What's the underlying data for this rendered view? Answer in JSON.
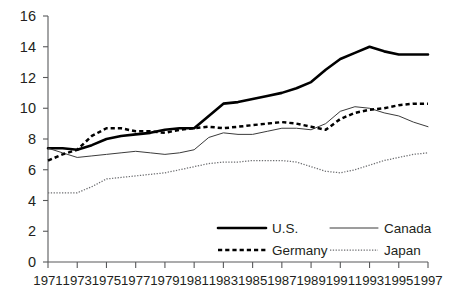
{
  "chart_data": {
    "type": "line",
    "title": "",
    "xlabel": "",
    "ylabel": "",
    "ylim": [
      0,
      16
    ],
    "xlim": [
      1971,
      1997
    ],
    "grid": false,
    "legend_position": "inside-bottom-center",
    "y_ticks": [
      "0",
      "2",
      "4",
      "6",
      "8",
      "10",
      "12",
      "14",
      "16"
    ],
    "x_ticks": [
      "1971",
      "1973",
      "1975",
      "1977",
      "1979",
      "1981",
      "1983",
      "1985",
      "1987",
      "1989",
      "1991",
      "1993",
      "1995",
      "1997"
    ],
    "x": [
      1971,
      1972,
      1973,
      1974,
      1975,
      1976,
      1977,
      1978,
      1979,
      1980,
      1981,
      1982,
      1983,
      1984,
      1985,
      1986,
      1987,
      1988,
      1989,
      1990,
      1991,
      1992,
      1993,
      1994,
      1995,
      1996,
      1997
    ],
    "series": [
      {
        "name": "U.S.",
        "style": "thick-solid",
        "values": [
          7.4,
          7.4,
          7.3,
          7.6,
          8.0,
          8.2,
          8.3,
          8.4,
          8.6,
          8.7,
          8.7,
          9.5,
          10.3,
          10.4,
          10.6,
          10.8,
          11.0,
          11.3,
          11.7,
          12.5,
          13.2,
          13.6,
          14.0,
          13.7,
          13.5,
          13.5,
          13.5
        ]
      },
      {
        "name": "Canada",
        "style": "thin-solid",
        "values": [
          7.4,
          7.1,
          6.8,
          6.9,
          7.0,
          7.1,
          7.2,
          7.1,
          7.0,
          7.1,
          7.3,
          8.1,
          8.4,
          8.3,
          8.3,
          8.5,
          8.7,
          8.7,
          8.6,
          9.0,
          9.8,
          10.1,
          10.0,
          9.7,
          9.5,
          9.1,
          8.8
        ]
      },
      {
        "name": "Germany",
        "style": "dashed",
        "values": [
          6.6,
          7.0,
          7.3,
          8.2,
          8.7,
          8.7,
          8.5,
          8.5,
          8.4,
          8.6,
          8.7,
          8.8,
          8.7,
          8.8,
          8.9,
          9.0,
          9.1,
          9.0,
          8.8,
          8.6,
          9.3,
          9.7,
          9.9,
          10.0,
          10.2,
          10.3,
          10.3
        ]
      },
      {
        "name": "Japan",
        "style": "dotted",
        "values": [
          4.5,
          4.5,
          4.5,
          4.9,
          5.4,
          5.5,
          5.6,
          5.7,
          5.8,
          6.0,
          6.2,
          6.4,
          6.5,
          6.5,
          6.6,
          6.6,
          6.6,
          6.5,
          6.2,
          5.9,
          5.8,
          6.0,
          6.3,
          6.6,
          6.8,
          7.0,
          7.1
        ]
      }
    ]
  },
  "legend": {
    "entries": [
      {
        "label": "U.S."
      },
      {
        "label": "Canada"
      },
      {
        "label": "Germany"
      },
      {
        "label": "Japan"
      }
    ]
  },
  "colors": {
    "axis": "#58595b",
    "text": "#231f20",
    "us": "#000000",
    "canada": "#3b3b3b",
    "germany": "#000000",
    "japan": "#6d6e71",
    "background": "#ffffff"
  }
}
